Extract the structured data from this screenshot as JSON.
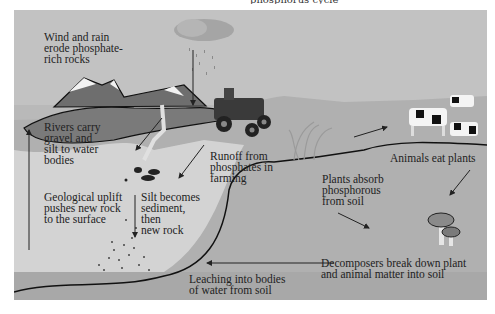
{
  "diagram": {
    "title_fragment": "phosphorus cycle",
    "background_color": "#b9b9b9",
    "labels": {
      "wind_rain": "Wind and rain\nerode phosphate-\nrich rocks",
      "rivers": "Rivers carry\ngravel and\nsilt to water\nbodies",
      "runoff": "Runoff from\nphosphates in\nfarming",
      "uplift": "Geological uplift\npushes new rock\nto the surface",
      "silt": "Silt becomes\nsediment,\nthen\nnew rock",
      "plants_absorb": "Plants absorb\nphosphorous\nfrom soil",
      "animals_eat": "Animals eat plants",
      "decomposers": "Decomposers break down plant\nand animal matter into soil",
      "leaching": "Leaching into bodies\nof water from soil"
    },
    "illustrations": [
      "cloud-with-rain",
      "mountains",
      "tractor",
      "grass-plants",
      "cows",
      "mushrooms",
      "rocks-gravel",
      "sediment-dots"
    ]
  }
}
